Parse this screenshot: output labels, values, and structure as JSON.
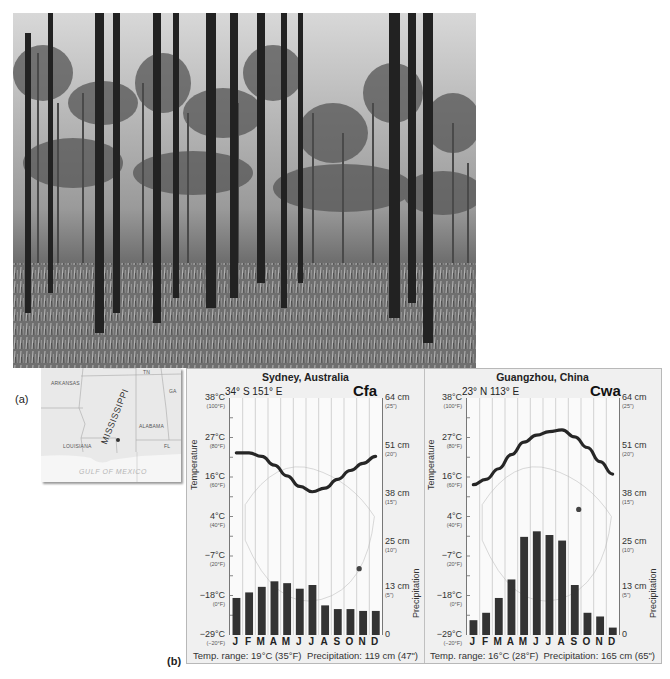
{
  "labels": {
    "part_a": "(a)",
    "part_b": "(b)"
  },
  "photo": {
    "subject": "longleaf pine forest",
    "alt": "Pine forest with tall thin trunks and grassy understory"
  },
  "map": {
    "states": [
      "ARKANSAS",
      "TN",
      "GA",
      "MISSISSIPPI",
      "ALABAMA",
      "LOUISIANA",
      "FL"
    ],
    "water": "GULF OF MEXICO"
  },
  "chart_data": [
    {
      "type": "bar+line",
      "title": "Sydney, Australia",
      "coords": "34° S  151° E",
      "climate_code": "Cfa",
      "categories": [
        "J",
        "F",
        "M",
        "A",
        "M",
        "J",
        "J",
        "A",
        "S",
        "O",
        "N",
        "D"
      ],
      "series": [
        {
          "name": "Temperature (°C)",
          "type": "line",
          "values": [
            22.5,
            22.5,
            21.5,
            19,
            16,
            13,
            11.5,
            12.5,
            15,
            17.5,
            19.5,
            21.5
          ]
        },
        {
          "name": "Precipitation (cm)",
          "type": "bar",
          "values": [
            10,
            11.5,
            13,
            14.5,
            14,
            12.5,
            13.5,
            8,
            7,
            7,
            6.5,
            6.5
          ]
        }
      ],
      "ylabel_left": "Temperature",
      "ylabel_right": "Precipitation",
      "left_ticks": [
        {
          "c": "38°C",
          "f": "(100°F)"
        },
        {
          "c": "27°C",
          "f": "(80°F)"
        },
        {
          "c": "16°C",
          "f": "(60°F)"
        },
        {
          "c": "4°C",
          "f": "(40°F)"
        },
        {
          "c": "−7°C",
          "f": "(20°F)"
        },
        {
          "c": "−18°C",
          "f": "(0°F)"
        },
        {
          "c": "−29°C",
          "f": "(−20°F)"
        }
      ],
      "right_ticks": [
        {
          "c": "64 cm",
          "f": "(25\")"
        },
        {
          "c": "51 cm",
          "f": "(20\")"
        },
        {
          "c": "38 cm",
          "f": "(15\")"
        },
        {
          "c": "25 cm",
          "f": "(10\")"
        },
        {
          "c": "13 cm",
          "f": "(5\")"
        },
        {
          "c": "0",
          "f": ""
        }
      ],
      "ylim_temp": [
        -29,
        38
      ],
      "ylim_precip": [
        0,
        64
      ],
      "temp_range": "Temp. range: 19°C (35°F)",
      "precip_total": "Precipitation: 119 cm (47\")",
      "location_marker": {
        "x_frac": 0.85,
        "y_frac": 0.72
      }
    },
    {
      "type": "bar+line",
      "title": "Guangzhou, China",
      "coords": "23° N  113° E",
      "climate_code": "Cwa",
      "categories": [
        "J",
        "F",
        "M",
        "A",
        "M",
        "J",
        "J",
        "A",
        "S",
        "O",
        "N",
        "D"
      ],
      "series": [
        {
          "name": "Temperature (°C)",
          "type": "line",
          "values": [
            13.5,
            15,
            18,
            22,
            25.5,
            27.5,
            28.5,
            29,
            27,
            24,
            20,
            16.5
          ]
        },
        {
          "name": "Precipitation (cm)",
          "type": "bar",
          "values": [
            4,
            6,
            10,
            15,
            26.5,
            28,
            27,
            25.5,
            13.5,
            6,
            5,
            2
          ]
        }
      ],
      "ylabel_left": "Temperature",
      "ylabel_right": "Precipitation",
      "left_ticks": [
        {
          "c": "38°C",
          "f": "(100°F)"
        },
        {
          "c": "27°C",
          "f": "(80°F)"
        },
        {
          "c": "16°C",
          "f": "(60°F)"
        },
        {
          "c": "4°C",
          "f": "(40°F)"
        },
        {
          "c": "−7°C",
          "f": "(20°F)"
        },
        {
          "c": "−18°C",
          "f": "(0°F)"
        },
        {
          "c": "−29°C",
          "f": "(−20°F)"
        }
      ],
      "right_ticks": [
        {
          "c": "64 cm",
          "f": "(25\")"
        },
        {
          "c": "51 cm",
          "f": "(20\")"
        },
        {
          "c": "38 cm",
          "f": "(15\")"
        },
        {
          "c": "25 cm",
          "f": "(10\")"
        },
        {
          "c": "13 cm",
          "f": "(5\")"
        },
        {
          "c": "0",
          "f": ""
        }
      ],
      "ylim_temp": [
        -29,
        38
      ],
      "ylim_precip": [
        0,
        64
      ],
      "temp_range": "Temp. range: 16°C (28°F)",
      "precip_total": "Precipitation: 165 cm (65\")",
      "location_marker": {
        "x_frac": 0.735,
        "y_frac": 0.47
      }
    }
  ]
}
